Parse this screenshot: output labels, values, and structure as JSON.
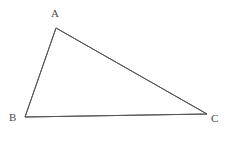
{
  "figure": {
    "type": "triangle",
    "name": "triangle-ABC",
    "background_color": "#ffffff",
    "stroke_color": "#555555",
    "stroke_width": 1,
    "canvas": {
      "width": 228,
      "height": 144
    },
    "vertices": [
      {
        "id": "A",
        "label": "A",
        "x": 56,
        "y": 28,
        "label_x": 51,
        "label_y": 8
      },
      {
        "id": "B",
        "label": "B",
        "x": 25,
        "y": 117,
        "label_x": 9,
        "label_y": 112
      },
      {
        "id": "C",
        "label": "C",
        "x": 207,
        "y": 114,
        "label_x": 211,
        "label_y": 113
      }
    ],
    "edges": [
      {
        "id": "AB",
        "from": "A",
        "to": "B",
        "path": "56,28 25,117"
      },
      {
        "id": "AC",
        "from": "A",
        "to": "C",
        "path": "56,28 207,114"
      },
      {
        "id": "BC",
        "from": "B",
        "to": "C",
        "path": "25,117 207,114"
      }
    ],
    "polygon_points": "56,28 207,114 25,117"
  }
}
